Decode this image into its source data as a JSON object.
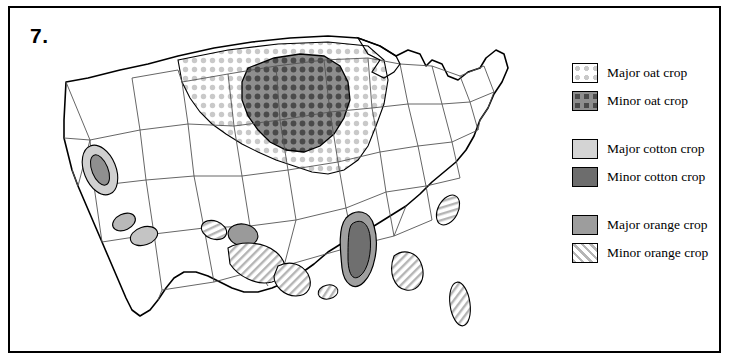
{
  "question": {
    "number": "7."
  },
  "legend": {
    "groups": [
      {
        "items": [
          {
            "label": "Major oat crop",
            "pattern": "dots-light",
            "swatch_name": "swatch-major-oat"
          },
          {
            "label": "Minor oat crop",
            "pattern": "dots-dark",
            "swatch_name": "swatch-minor-oat"
          }
        ]
      },
      {
        "items": [
          {
            "label": "Major cotton crop",
            "pattern": "solid-light-gray",
            "swatch_name": "swatch-major-cotton"
          },
          {
            "label": "Minor cotton crop",
            "pattern": "solid-dark-gray",
            "swatch_name": "swatch-minor-cotton"
          }
        ]
      },
      {
        "items": [
          {
            "label": "Major orange crop",
            "pattern": "solid-medium-gray",
            "swatch_name": "swatch-major-orange"
          },
          {
            "label": "Minor orange crop",
            "pattern": "diagonal-hatch",
            "swatch_name": "swatch-minor-orange"
          }
        ]
      }
    ]
  },
  "map": {
    "title": "United States crop distribution map",
    "colors": {
      "outline": "#000000",
      "state_border": "#555555",
      "light_gray": "#d9d9d9",
      "medium_gray": "#a8a8a8",
      "dark_gray": "#7a7a7a",
      "background": "#ffffff"
    },
    "regions": [
      {
        "name": "upper-midwest-oat-major",
        "pattern": "dots-light"
      },
      {
        "name": "corn-belt-oat-minor",
        "pattern": "dots-dark"
      },
      {
        "name": "central-valley-orange",
        "pattern": "solid-medium-gray"
      },
      {
        "name": "southern-california-orange",
        "pattern": "solid-medium-gray"
      },
      {
        "name": "arizona-cotton",
        "pattern": "diagonal-hatch"
      },
      {
        "name": "west-texas-cotton",
        "pattern": "diagonal-hatch"
      },
      {
        "name": "south-texas-cotton",
        "pattern": "diagonal-hatch"
      },
      {
        "name": "mississippi-delta-cotton",
        "pattern": "solid-dark-gray"
      },
      {
        "name": "gulf-coast-cotton",
        "pattern": "diagonal-hatch"
      },
      {
        "name": "southeast-cotton",
        "pattern": "diagonal-hatch"
      },
      {
        "name": "florida-orange",
        "pattern": "diagonal-hatch"
      },
      {
        "name": "carolina-cotton",
        "pattern": "diagonal-hatch"
      }
    ]
  }
}
